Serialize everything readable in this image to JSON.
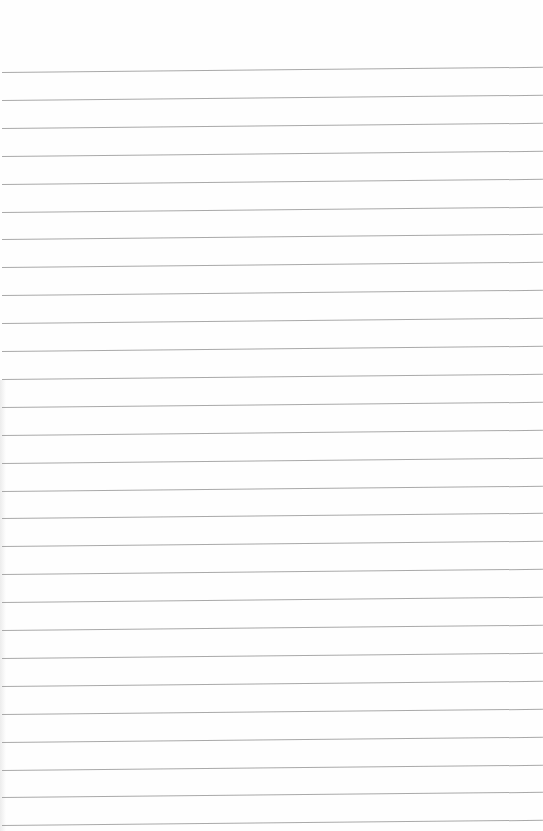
{
  "paper": {
    "type": "lined-paper",
    "background_color": "#ffffff",
    "line_color": "#9a9a9a",
    "line_count": 28,
    "first_line_y": 72,
    "line_spacing": 27.9,
    "tilt_px": 5
  }
}
